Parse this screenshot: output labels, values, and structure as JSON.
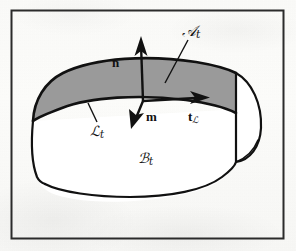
{
  "figure": {
    "kind": "line-drawing",
    "frame": {
      "border_color": "#2b2b2b",
      "border_width_px": 2,
      "background": "#fbfbf9"
    },
    "palette": {
      "ink": "#111111",
      "outline": "#111111",
      "surface_fill": "#9a9a9a",
      "body_fill": "#ffffff",
      "paper": "#fbfbf9"
    },
    "body": {
      "name": "body-region",
      "label_main": "ℬ",
      "label_sub": "t",
      "label_full": "ℬt",
      "description": "Three-dimensional body region B sub t"
    },
    "surface": {
      "name": "surface-patch",
      "label_main": "𝒜",
      "label_sub": "t",
      "label_full": "𝒜t",
      "fill": "#9a9a9a",
      "description": "Shaded oriented surface patch A sub t on the body"
    },
    "curve": {
      "name": "boundary-curve",
      "label_main": "ℒ",
      "label_sub": "t",
      "label_full": "ℒt",
      "description": "Boundary curve L sub t of the surface patch"
    },
    "vectors": [
      {
        "id": "n",
        "name": "normal-vector",
        "label": "n",
        "sub": "",
        "direction": "up",
        "description": "Unit normal to the surface patch"
      },
      {
        "id": "m",
        "name": "conormal-vector",
        "label": "m",
        "sub": "",
        "direction": "down-left",
        "description": "Unit conormal pointing into the body"
      },
      {
        "id": "t",
        "name": "tangent-vector",
        "label": "t",
        "sub": "ℒ",
        "direction": "right",
        "description": "Unit tangent to the boundary curve"
      }
    ],
    "leaders": [
      {
        "name": "leader-surface",
        "from_label": "𝒜t",
        "to": "surface-patch"
      },
      {
        "name": "leader-curve",
        "from_label": "ℒt",
        "to": "boundary-curve"
      }
    ]
  }
}
